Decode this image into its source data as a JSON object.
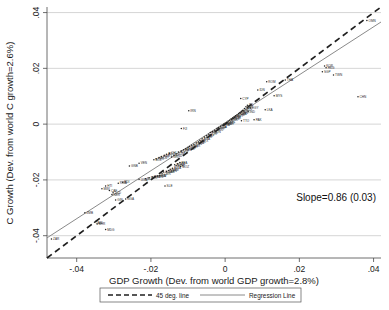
{
  "chart_data": {
    "type": "scatter",
    "title": "",
    "xlabel": "GDP Growth (Dev. from world GDP growth=2.8%)",
    "ylabel": "C Growth (Dev. from world C growth=2.6%)",
    "xlim": [
      -0.048,
      0.042
    ],
    "ylim": [
      -0.048,
      0.042
    ],
    "xticks": [
      -0.04,
      -0.02,
      0,
      0.02,
      0.04
    ],
    "xtick_labels": [
      "-.04",
      "-.02",
      "0",
      ".02",
      ".04"
    ],
    "yticks": [
      -0.04,
      -0.02,
      0,
      0.02,
      0.04
    ],
    "ytick_labels": [
      "-.04",
      "-.02",
      "0",
      ".02",
      ".04"
    ],
    "grid": "horizontal",
    "annotation": "Slope=0.86 (0.03)",
    "legend_position": "below-axis",
    "legend": [
      {
        "label": "45 deg. line",
        "style": "dashed"
      },
      {
        "label": "Regression Line",
        "style": "solid"
      }
    ],
    "lines": [
      {
        "name": "45 deg. line",
        "slope": 1.0,
        "intercept": 0.0,
        "style": "dashed"
      },
      {
        "name": "Regression Line",
        "slope": 0.86,
        "intercept": 0.0005,
        "style": "solid"
      }
    ],
    "regression": {
      "slope": 0.86,
      "std_error": 0.03
    },
    "points": [
      {
        "label": "ZAR",
        "x": -0.0468,
        "y": -0.0412
      },
      {
        "label": "MDG",
        "x": -0.0322,
        "y": -0.0378
      },
      {
        "label": "BHR",
        "x": -0.0345,
        "y": -0.0358
      },
      {
        "label": "JAM",
        "x": -0.0352,
        "y": -0.0352
      },
      {
        "label": "ZMB",
        "x": -0.0378,
        "y": -0.0318
      },
      {
        "label": "NGA",
        "x": -0.0268,
        "y": -0.0268
      },
      {
        "label": "GIN",
        "x": -0.0295,
        "y": -0.0272
      },
      {
        "label": "NER",
        "x": -0.0305,
        "y": -0.0252
      },
      {
        "label": "TCD",
        "x": -0.0302,
        "y": -0.0246
      },
      {
        "label": "CAF",
        "x": -0.0312,
        "y": -0.0238
      },
      {
        "label": "HTI",
        "x": -0.0322,
        "y": -0.0222
      },
      {
        "label": "MWI",
        "x": -0.0332,
        "y": -0.0232
      },
      {
        "label": "RWA",
        "x": -0.0288,
        "y": -0.0212
      },
      {
        "label": "BDI",
        "x": -0.0276,
        "y": -0.0208
      },
      {
        "label": "SLE",
        "x": -0.0162,
        "y": -0.0222
      },
      {
        "label": "UGA",
        "x": -0.0232,
        "y": -0.0198
      },
      {
        "label": "MLI",
        "x": -0.0215,
        "y": -0.0196
      },
      {
        "label": "TGO",
        "x": -0.0205,
        "y": -0.0192
      },
      {
        "label": "BEN",
        "x": -0.0196,
        "y": -0.019
      },
      {
        "label": "SEN",
        "x": -0.0188,
        "y": -0.0188
      },
      {
        "label": "GHA",
        "x": -0.0182,
        "y": -0.0186
      },
      {
        "label": "CIV",
        "x": -0.0176,
        "y": -0.0184
      },
      {
        "label": "CMR",
        "x": -0.017,
        "y": -0.0178
      },
      {
        "label": "COG",
        "x": -0.0166,
        "y": -0.0172
      },
      {
        "label": "GAB",
        "x": -0.0158,
        "y": -0.017
      },
      {
        "label": "KEN",
        "x": -0.0152,
        "y": -0.0166
      },
      {
        "label": "NAM",
        "x": -0.0148,
        "y": -0.0162
      },
      {
        "label": "BWA",
        "x": -0.0142,
        "y": -0.0158
      },
      {
        "label": "GNB",
        "x": -0.0258,
        "y": -0.015
      },
      {
        "label": "VEN",
        "x": -0.0232,
        "y": -0.014
      },
      {
        "label": "MOZ",
        "x": -0.012,
        "y": -0.0152
      },
      {
        "label": "ETH",
        "x": -0.0132,
        "y": -0.0148
      },
      {
        "label": "SDN",
        "x": -0.0136,
        "y": -0.0146
      },
      {
        "label": "TZA",
        "x": -0.0128,
        "y": -0.0142
      },
      {
        "label": "BFA",
        "x": -0.0122,
        "y": -0.0138
      },
      {
        "label": "BOL",
        "x": -0.0192,
        "y": -0.0128
      },
      {
        "label": "PER",
        "x": -0.0186,
        "y": -0.0124
      },
      {
        "label": "ECU",
        "x": -0.0178,
        "y": -0.012
      },
      {
        "label": "PRY",
        "x": -0.0172,
        "y": -0.0116
      },
      {
        "label": "URY",
        "x": -0.0164,
        "y": -0.0112
      },
      {
        "label": "ARG",
        "x": -0.0158,
        "y": -0.0108
      },
      {
        "label": "CHL",
        "x": -0.015,
        "y": -0.0104
      },
      {
        "label": "NIC",
        "x": -0.0144,
        "y": -0.0118
      },
      {
        "label": "HND",
        "x": -0.0138,
        "y": -0.0112
      },
      {
        "label": "GTM",
        "x": -0.0132,
        "y": -0.0106
      },
      {
        "label": "SLV",
        "x": -0.0126,
        "y": -0.01
      },
      {
        "label": "CRI",
        "x": -0.0118,
        "y": -0.0096
      },
      {
        "label": "PAN",
        "x": -0.0112,
        "y": -0.0092
      },
      {
        "label": "DOM",
        "x": -0.0106,
        "y": -0.0088
      },
      {
        "label": "JOR",
        "x": -0.01,
        "y": -0.0084
      },
      {
        "label": "SYR",
        "x": -0.0096,
        "y": -0.008
      },
      {
        "label": "MAR",
        "x": -0.009,
        "y": -0.0076
      },
      {
        "label": "TUN",
        "x": -0.0084,
        "y": -0.0072
      },
      {
        "label": "DZA",
        "x": -0.0078,
        "y": -0.0068
      },
      {
        "label": "PHL",
        "x": -0.0072,
        "y": -0.0064
      },
      {
        "label": "IRN",
        "x": -0.0098,
        "y": 0.0048
      },
      {
        "label": "FJI",
        "x": -0.0118,
        "y": -0.0016
      },
      {
        "label": "MEX",
        "x": -0.0068,
        "y": -0.0058
      },
      {
        "label": "BRA",
        "x": -0.0062,
        "y": -0.0052
      },
      {
        "label": "COL",
        "x": -0.0056,
        "y": -0.0046
      },
      {
        "label": "ZAF",
        "x": -0.005,
        "y": -0.0042
      },
      {
        "label": "TUR",
        "x": -0.0044,
        "y": -0.0036
      },
      {
        "label": "POL",
        "x": -0.004,
        "y": -0.003
      },
      {
        "label": "HUN",
        "x": -0.0034,
        "y": -0.0026
      },
      {
        "label": "GRC",
        "x": -0.0028,
        "y": -0.0022
      },
      {
        "label": "PRT",
        "x": -0.0022,
        "y": -0.0016
      },
      {
        "label": "ESP",
        "x": -0.0018,
        "y": -0.0012
      },
      {
        "label": "ITA",
        "x": -0.0012,
        "y": -0.0008
      },
      {
        "label": "FRA",
        "x": -0.0008,
        "y": -0.0004
      },
      {
        "label": "DEU",
        "x": -0.0004,
        "y": 0.0
      },
      {
        "label": "GBR",
        "x": 0.0,
        "y": 0.0002
      },
      {
        "label": "NLD",
        "x": 0.0004,
        "y": 0.0006
      },
      {
        "label": "BEL",
        "x": 0.0008,
        "y": 0.001
      },
      {
        "label": "DNK",
        "x": 0.0012,
        "y": 0.0014
      },
      {
        "label": "SWE",
        "x": 0.0016,
        "y": 0.0018
      },
      {
        "label": "NOR",
        "x": 0.002,
        "y": 0.0022
      },
      {
        "label": "FIN",
        "x": 0.0024,
        "y": 0.0026
      },
      {
        "label": "AUT",
        "x": 0.0028,
        "y": 0.003
      },
      {
        "label": "CHE",
        "x": 0.0032,
        "y": 0.0034
      },
      {
        "label": "USA",
        "x": 0.0036,
        "y": 0.0038
      },
      {
        "label": "CAN",
        "x": 0.004,
        "y": 0.0042
      },
      {
        "label": "AUS",
        "x": 0.0044,
        "y": 0.0046
      },
      {
        "label": "NZL",
        "x": 0.0048,
        "y": 0.005
      },
      {
        "label": "JPN",
        "x": 0.0052,
        "y": 0.0056
      },
      {
        "label": "ISR",
        "x": 0.0056,
        "y": 0.0062
      },
      {
        "label": "IRL",
        "x": 0.006,
        "y": 0.0068
      },
      {
        "label": "EGY",
        "x": 0.0068,
        "y": 0.0058
      },
      {
        "label": "IND",
        "x": 0.0062,
        "y": 0.0046
      },
      {
        "label": "PAK",
        "x": 0.0078,
        "y": 0.0016
      },
      {
        "label": "TTO",
        "x": 0.0044,
        "y": 0.0012
      },
      {
        "label": "LKA",
        "x": 0.0108,
        "y": 0.0052
      },
      {
        "label": "CYP",
        "x": 0.0042,
        "y": 0.0092
      },
      {
        "label": "IDN",
        "x": 0.0088,
        "y": 0.0122
      },
      {
        "label": "ROM",
        "x": 0.0112,
        "y": 0.0152
      },
      {
        "label": "MYS",
        "x": 0.0132,
        "y": 0.0102
      },
      {
        "label": "THA",
        "x": 0.0162,
        "y": 0.0158
      },
      {
        "label": "KOR",
        "x": 0.0268,
        "y": 0.0208
      },
      {
        "label": "HKG",
        "x": 0.0272,
        "y": 0.0202
      },
      {
        "label": "TWN",
        "x": 0.0292,
        "y": 0.0176
      },
      {
        "label": "SGP",
        "x": 0.0262,
        "y": 0.0188
      },
      {
        "label": "CHN",
        "x": 0.0358,
        "y": 0.0098
      },
      {
        "label": "OMN",
        "x": 0.0382,
        "y": 0.0372
      }
    ]
  }
}
